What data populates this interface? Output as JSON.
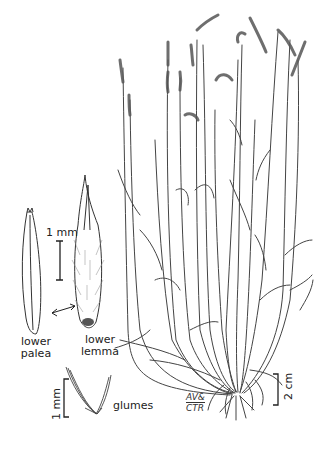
{
  "illustration": {
    "subject": "grass plant botanical line drawing",
    "labels": {
      "lower_palea": "lower\npalea",
      "lower_palea_line1": "lower",
      "lower_palea_line2": "palea",
      "lower_lemma_line1": "lower",
      "lower_lemma_line2": "lemma",
      "glumes": "glumes"
    },
    "scale_bars": {
      "spikelet_scale": "1 mm",
      "glume_scale": "1 mm",
      "plant_scale": "2 cm"
    },
    "signature": {
      "line1": "AV&",
      "line2": "CTR"
    },
    "colors": {
      "ink": "#333333",
      "background": "#ffffff"
    }
  }
}
